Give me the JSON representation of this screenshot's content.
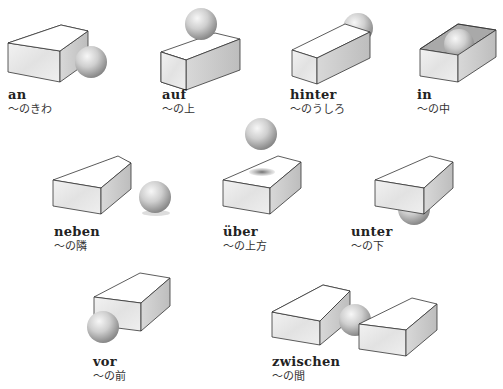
{
  "colors": {
    "box_top": "#ffffff",
    "box_front": "#e9e9e9",
    "box_side": "#cfcfcf",
    "box_inner": "#bdbdbd",
    "edge": "#333333",
    "sphere_light": "#f4f4f4",
    "sphere_mid": "#bdbdbd",
    "sphere_dark": "#7d7d7d",
    "shadow": "#8a8a8a"
  },
  "items": [
    {
      "id": "an",
      "word": "an",
      "gloss": "〜のきわ",
      "label_x": 8,
      "label_y": 88
    },
    {
      "id": "auf",
      "word": "auf",
      "gloss": "〜の上",
      "label_x": 162,
      "label_y": 88
    },
    {
      "id": "hinter",
      "word": "hinter",
      "gloss": "〜のうしろ",
      "label_x": 290,
      "label_y": 88
    },
    {
      "id": "in",
      "word": "in",
      "gloss": "〜の中",
      "label_x": 417,
      "label_y": 88
    },
    {
      "id": "neben",
      "word": "neben",
      "gloss": "〜の隣",
      "label_x": 54,
      "label_y": 225
    },
    {
      "id": "ueber",
      "word": "über",
      "gloss": "〜の上方",
      "label_x": 223,
      "label_y": 225
    },
    {
      "id": "unter",
      "word": "unter",
      "gloss": "〜の下",
      "label_x": 351,
      "label_y": 225
    },
    {
      "id": "vor",
      "word": "vor",
      "gloss": "〜の前",
      "label_x": 93,
      "label_y": 355
    },
    {
      "id": "zwischen",
      "word": "zwischen",
      "gloss": "〜の間",
      "label_x": 272,
      "label_y": 355
    }
  ]
}
